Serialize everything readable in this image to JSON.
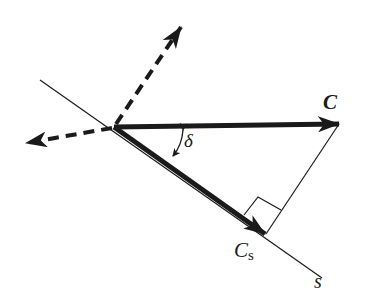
{
  "diagram": {
    "type": "vector-projection",
    "labels": {
      "vector_c": "C",
      "vector_cs_main": "C",
      "vector_cs_sub": "s",
      "axis_s": "s",
      "angle": "δ"
    },
    "colors": {
      "stroke": "#1a1a1a",
      "background": "#ffffff"
    },
    "elements": [
      {
        "name": "vector-C",
        "style": "thick-solid-arrow",
        "from": [
          114,
          127
        ],
        "to": [
          339,
          124
        ]
      },
      {
        "name": "vector-Cs",
        "style": "thick-solid-arrow",
        "from": [
          114,
          127
        ],
        "to": [
          265,
          234
        ]
      },
      {
        "name": "axis-s",
        "style": "thin-line",
        "from": [
          40,
          80
        ],
        "to": [
          322,
          278
        ]
      },
      {
        "name": "projection-line",
        "style": "thin-line",
        "from": [
          339,
          124
        ],
        "to": [
          266,
          234
        ]
      },
      {
        "name": "dashed-arrow-up",
        "style": "thick-dashed-arrow",
        "from": [
          114,
          127
        ],
        "to": [
          181,
          27
        ]
      },
      {
        "name": "dashed-arrow-left",
        "style": "thick-dashed-arrow",
        "from": [
          114,
          127
        ],
        "to": [
          26,
          143
        ]
      },
      {
        "name": "right-angle-marker",
        "style": "thin-square"
      },
      {
        "name": "angle-delta-arc",
        "style": "double-headed-arc"
      }
    ]
  }
}
